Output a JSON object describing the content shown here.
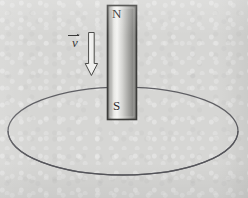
{
  "figure": {
    "background_color": "#d6d6d4",
    "ink_color": "#3a3a3a"
  },
  "magnet": {
    "north_pole_label": "N",
    "south_pole_label": "S",
    "body_color_light": "#f2f2f0",
    "body_color_dark": "#6f6f6d",
    "border_color": "#3c3c3a",
    "x": 107,
    "y": 5,
    "width": 30,
    "height": 115
  },
  "velocity": {
    "symbol": "v",
    "accent": "vector-arrow-overbar",
    "direction": "down",
    "arrow_fill": "#ececea",
    "arrow_outline": "#4a4a48"
  },
  "loop": {
    "shape": "ellipse",
    "center_x": 123,
    "center_y": 131,
    "radius_x": 115,
    "radius_y": 44,
    "stroke_color": "#55555a"
  },
  "icons": {
    "down_arrow": "down-arrow-icon",
    "magnet": "bar-magnet-icon",
    "loop": "conducting-loop-icon"
  }
}
